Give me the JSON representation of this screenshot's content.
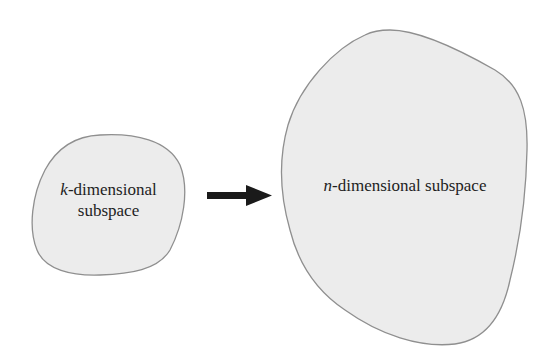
{
  "diagram": {
    "source": {
      "label_var": "k",
      "label_line1_rest": "-dimensional",
      "label_line2": "subspace",
      "fill": "#ececec",
      "stroke": "#8f8f8f"
    },
    "arrow": {
      "direction": "right",
      "color": "#1a1a1a"
    },
    "target": {
      "label_var": "n",
      "label_rest": "-dimensional subspace",
      "fill": "#ececec",
      "stroke": "#8f8f8f"
    }
  }
}
